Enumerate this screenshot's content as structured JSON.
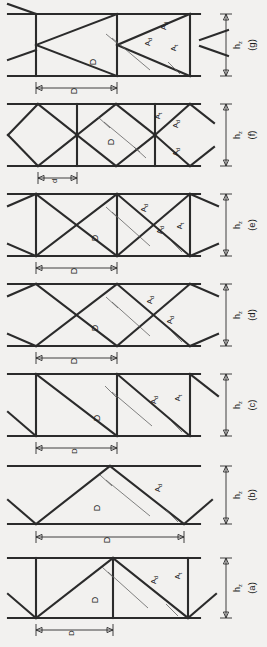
{
  "figure": {
    "orientation": "rotated-90-ccw",
    "background_color": "#f2f1ef",
    "line_color": "#2b2b2b",
    "leader_color": "#5a5a5a"
  },
  "labels": {
    "height": "h",
    "height_sub": "z",
    "panel_width_major": "D",
    "panel_width_minor": "d",
    "diagonal_area": "A",
    "diagonal_area_sub": "d",
    "post_area": "A",
    "post_area_sub": "t",
    "diagonal_length": "D"
  },
  "panels": [
    {
      "id": "g",
      "letter": "(g)",
      "height_label": "h",
      "height_sub": "z",
      "span_label": "D",
      "span_kind": "major",
      "web_type": "k-truss-double-triangle",
      "member_labels": [
        "A_d",
        "A_d",
        "A_t"
      ],
      "diagonal_length_label": "D",
      "has_post": true
    },
    {
      "id": "f",
      "letter": "(f)",
      "height_label": "h",
      "height_sub": "z",
      "span_label": "d",
      "span_kind": "minor",
      "web_type": "lattice-diamond",
      "member_labels": [
        "A_t",
        "A_d",
        "A_d"
      ],
      "diagonal_length_label": "D",
      "has_post": true
    },
    {
      "id": "e",
      "letter": "(e)",
      "height_label": "h",
      "height_sub": "z",
      "span_label": "D",
      "span_kind": "major",
      "web_type": "x-braced-with-posts",
      "member_labels": [
        "A_d",
        "A_d",
        "A_t"
      ],
      "diagonal_length_label": "D",
      "has_post": true
    },
    {
      "id": "d",
      "letter": "(d)",
      "height_label": "h",
      "height_sub": "z",
      "span_label": "D",
      "span_kind": "major",
      "web_type": "x-braced-no-posts",
      "member_labels": [
        "A_d",
        "A_d"
      ],
      "diagonal_length_label": "D",
      "has_post": false
    },
    {
      "id": "c",
      "letter": "(c)",
      "height_label": "h",
      "height_sub": "z",
      "span_label": "D",
      "span_kind": "major",
      "web_type": "pratt-single-diagonal",
      "member_labels": [
        "A_d",
        "A_t"
      ],
      "diagonal_length_label": "D",
      "has_post": true
    },
    {
      "id": "b",
      "letter": "(b)",
      "height_label": "h",
      "height_sub": "z",
      "span_label": "D",
      "span_kind": "major",
      "web_type": "warren-no-posts",
      "member_labels": [
        "A_d"
      ],
      "diagonal_length_label": "D",
      "has_post": false
    },
    {
      "id": "a",
      "letter": "(a)",
      "height_label": "h",
      "height_sub": "z",
      "span_label": "D",
      "span_kind": "major",
      "web_type": "warren-with-posts",
      "member_labels": [
        "A_d",
        "A_t"
      ],
      "diagonal_length_label": "D",
      "has_post": true
    }
  ]
}
